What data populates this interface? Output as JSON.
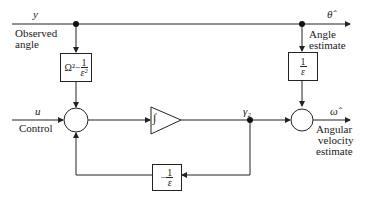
{
  "diagram": {
    "type": "block-diagram",
    "inputs": {
      "y": {
        "symbol": "y",
        "label_line1": "Observed",
        "label_line2": "angle"
      },
      "u": {
        "symbol": "u",
        "label": "Control"
      }
    },
    "outputs": {
      "theta_hat": {
        "symbol": "θ̂",
        "label_line1": "Angle",
        "label_line2": "estimate"
      },
      "omega_hat": {
        "symbol": "ω̂",
        "label_line1": "Angular",
        "label_line2": "velocity",
        "label_line3": "estimate"
      }
    },
    "signals": {
      "gamma2": "γ₂"
    },
    "blocks": {
      "gain_left": {
        "prefix": "Ω²−",
        "num": "1",
        "den": "ε²"
      },
      "gain_right": {
        "num": "1",
        "den": "ε"
      },
      "feedback": {
        "prefix": "−",
        "num": "1",
        "den": "ε"
      },
      "integrator": {
        "symbol": "∫"
      }
    },
    "colors": {
      "line": "#222222",
      "background": "#ffffff"
    }
  }
}
